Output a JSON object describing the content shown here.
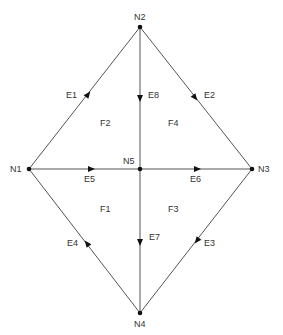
{
  "diagram": {
    "type": "planar-graph",
    "nodes": [
      {
        "id": "N1",
        "label": "N1",
        "x": 29,
        "y": 169,
        "lx": 10,
        "ly": 172
      },
      {
        "id": "N2",
        "label": "N2",
        "x": 140,
        "y": 27,
        "lx": 134,
        "ly": 20
      },
      {
        "id": "N3",
        "label": "N3",
        "x": 252,
        "y": 169,
        "lx": 258,
        "ly": 172
      },
      {
        "id": "N4",
        "label": "N4",
        "x": 140,
        "y": 313,
        "lx": 134,
        "ly": 327
      },
      {
        "id": "N5",
        "label": "N5",
        "x": 140,
        "y": 169,
        "lx": 123,
        "ly": 164
      }
    ],
    "edges": [
      {
        "id": "E1",
        "label": "E1",
        "from": "N1",
        "to": "N2",
        "lx": 66,
        "ly": 98
      },
      {
        "id": "E2",
        "label": "E2",
        "from": "N2",
        "to": "N3",
        "lx": 204,
        "ly": 98
      },
      {
        "id": "E3",
        "label": "E3",
        "from": "N3",
        "to": "N4",
        "lx": 204,
        "ly": 246
      },
      {
        "id": "E4",
        "label": "E4",
        "from": "N4",
        "to": "N1",
        "lx": 67,
        "ly": 246
      },
      {
        "id": "E5",
        "label": "E5",
        "from": "N1",
        "to": "N5",
        "lx": 84,
        "ly": 182
      },
      {
        "id": "E6",
        "label": "E6",
        "from": "N5",
        "to": "N3",
        "lx": 190,
        "ly": 182
      },
      {
        "id": "E7",
        "label": "E7",
        "from": "N5",
        "to": "N4",
        "lx": 149,
        "ly": 240
      },
      {
        "id": "E8",
        "label": "E8",
        "from": "N2",
        "to": "N5",
        "lx": 148,
        "ly": 98
      }
    ],
    "faces": [
      {
        "id": "F1",
        "label": "F1",
        "x": 100,
        "y": 212
      },
      {
        "id": "F2",
        "label": "F2",
        "x": 100,
        "y": 126
      },
      {
        "id": "F3",
        "label": "F3",
        "x": 168,
        "y": 212
      },
      {
        "id": "F4",
        "label": "F4",
        "x": 168,
        "y": 126
      }
    ],
    "colors": {
      "edge": "#555555",
      "node": "#111111",
      "text": "#333333",
      "background": "#ffffff"
    }
  }
}
